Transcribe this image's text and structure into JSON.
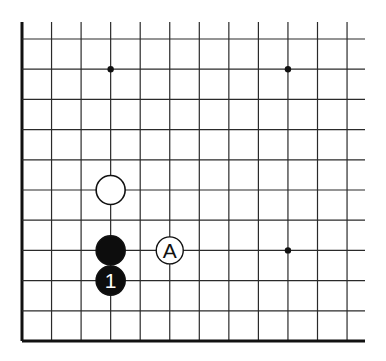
{
  "diagram": {
    "board": {
      "columns_visible": 12,
      "rows_visible": 11,
      "edges": [
        "left",
        "bottom"
      ],
      "line_color": "#2a2a2a",
      "edge_color": "#111111",
      "background": "#ffffff"
    },
    "star_points": [
      {
        "col": 3,
        "row": 1
      },
      {
        "col": 9,
        "row": 1
      },
      {
        "col": 9,
        "row": 7
      }
    ],
    "stones": [
      {
        "color": "white",
        "col": 3,
        "row": 5,
        "label": ""
      },
      {
        "color": "black",
        "col": 3,
        "row": 7,
        "label": ""
      },
      {
        "color": "black",
        "col": 3,
        "row": 8,
        "label": "1"
      }
    ],
    "markers": [
      {
        "type": "letter-circle",
        "col": 5,
        "row": 7,
        "label": "A"
      }
    ]
  }
}
